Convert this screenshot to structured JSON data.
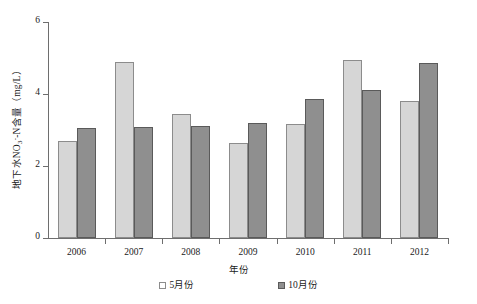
{
  "chart_data": {
    "type": "bar",
    "title": "",
    "xlabel": "年份",
    "ylabel": "地下水NO3--N含量（mg/L）",
    "ylabel_parts": {
      "prefix": "地下水NO",
      "sub": "3",
      "sup": "-",
      "suffix": "-N含量（mg/L）"
    },
    "categories": [
      "2006",
      "2007",
      "2008",
      "2009",
      "2010",
      "2011",
      "2012"
    ],
    "series": [
      {
        "name": "5月份",
        "values": [
          2.7,
          4.88,
          3.45,
          2.65,
          3.17,
          4.95,
          3.8
        ],
        "color": "#d6d6d6"
      },
      {
        "name": "10月份",
        "values": [
          3.05,
          3.07,
          3.12,
          3.2,
          3.86,
          4.1,
          4.85
        ],
        "color": "#8f8f8f"
      }
    ],
    "ylim": [
      0,
      6
    ],
    "yticks": [
      "0",
      "2",
      "4",
      "6"
    ],
    "ytick_values": [
      0,
      2,
      4,
      6
    ],
    "grid": false,
    "legend_position": "bottom"
  }
}
